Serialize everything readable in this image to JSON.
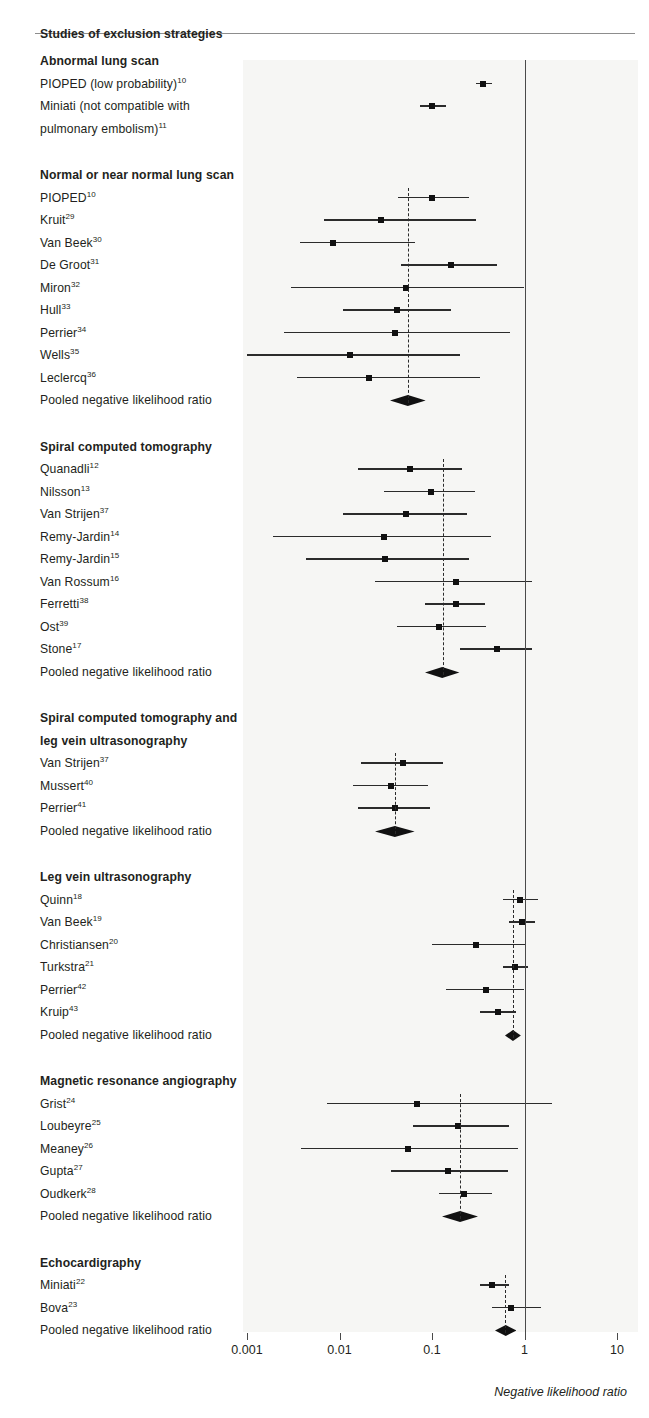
{
  "figure": {
    "title": "Studies of exclusion strategies",
    "axis_title": "Negative likelihood ratio",
    "pooled_label": "Pooled negative likelihood ratio"
  },
  "chart_data": {
    "type": "forest",
    "title": "Studies of exclusion strategies",
    "xlabel": "Negative likelihood ratio",
    "xscale": "log",
    "xlim": [
      0.001,
      10
    ],
    "ticks": [
      "0.001",
      "0.01",
      "0.1",
      "1",
      "10"
    ],
    "tick_values": [
      0.001,
      0.01,
      0.1,
      1,
      10
    ],
    "reference_line": 1,
    "effect_measure": "Negative likelihood ratio",
    "groups": [
      {
        "name": "Abnormal lung scan",
        "pooled": null,
        "studies": [
          {
            "label": "PIOPED (low probability)",
            "ref": "10",
            "estimate": 0.36,
            "lower": 0.3,
            "upper": 0.45
          },
          {
            "label": "Miniati (not compatible with pulmonary embolism)",
            "ref": "11",
            "estimate": 0.1,
            "lower": 0.075,
            "upper": 0.14
          }
        ]
      },
      {
        "name": "Normal or near normal lung scan",
        "pooled": {
          "estimate": 0.055,
          "lower": 0.035,
          "upper": 0.085
        },
        "studies": [
          {
            "label": "PIOPED",
            "ref": "10",
            "estimate": 0.1,
            "lower": 0.043,
            "upper": 0.25
          },
          {
            "label": "Kruit",
            "ref": "29",
            "estimate": 0.028,
            "lower": 0.0068,
            "upper": 0.3
          },
          {
            "label": "Van Beek",
            "ref": "30",
            "estimate": 0.0085,
            "lower": 0.0037,
            "upper": 0.065
          },
          {
            "label": "De Groot",
            "ref": "31",
            "estimate": 0.16,
            "lower": 0.046,
            "upper": 0.5
          },
          {
            "label": "Miron",
            "ref": "32",
            "estimate": 0.053,
            "lower": 0.003,
            "upper": 1.0
          },
          {
            "label": "Hull",
            "ref": "33",
            "estimate": 0.042,
            "lower": 0.011,
            "upper": 0.16
          },
          {
            "label": "Perrier",
            "ref": "34",
            "estimate": 0.04,
            "lower": 0.0025,
            "upper": 0.7
          },
          {
            "label": "Wells",
            "ref": "35",
            "estimate": 0.013,
            "lower": 0.001,
            "upper": 0.2
          },
          {
            "label": "Leclercq",
            "ref": "36",
            "estimate": 0.021,
            "lower": 0.0035,
            "upper": 0.33
          }
        ]
      },
      {
        "name": "Spiral computed tomography",
        "pooled": {
          "estimate": 0.13,
          "lower": 0.085,
          "upper": 0.2
        },
        "studies": [
          {
            "label": "Quanadli",
            "ref": "12",
            "estimate": 0.058,
            "lower": 0.016,
            "upper": 0.21
          },
          {
            "label": "Nilsson",
            "ref": "13",
            "estimate": 0.098,
            "lower": 0.03,
            "upper": 0.29
          },
          {
            "label": "Van Strijen",
            "ref": "37",
            "estimate": 0.053,
            "lower": 0.011,
            "upper": 0.24
          },
          {
            "label": "Remy-Jardin",
            "ref": "14",
            "estimate": 0.03,
            "lower": 0.0019,
            "upper": 0.43
          },
          {
            "label": "Remy-Jardin",
            "ref": "15",
            "estimate": 0.031,
            "lower": 0.0043,
            "upper": 0.25
          },
          {
            "label": "Van Rossum",
            "ref": "16",
            "estimate": 0.18,
            "lower": 0.024,
            "upper": 1.2
          },
          {
            "label": "Ferretti",
            "ref": "38",
            "estimate": 0.18,
            "lower": 0.085,
            "upper": 0.37
          },
          {
            "label": "Ost",
            "ref": "39",
            "estimate": 0.12,
            "lower": 0.042,
            "upper": 0.38
          },
          {
            "label": "Stone",
            "ref": "17",
            "estimate": 0.5,
            "lower": 0.2,
            "upper": 1.2
          }
        ]
      },
      {
        "name": "Spiral computed tomography and leg vein ultrasonography",
        "pooled": {
          "estimate": 0.04,
          "lower": 0.025,
          "upper": 0.067
        },
        "studies": [
          {
            "label": "Van Strijen",
            "ref": "37",
            "estimate": 0.048,
            "lower": 0.017,
            "upper": 0.13
          },
          {
            "label": "Mussert",
            "ref": "40",
            "estimate": 0.036,
            "lower": 0.014,
            "upper": 0.09
          },
          {
            "label": "Perrier",
            "ref": "41",
            "estimate": 0.04,
            "lower": 0.016,
            "upper": 0.095
          }
        ]
      },
      {
        "name": "Leg vein ultrasonography",
        "pooled": {
          "estimate": 0.75,
          "lower": 0.62,
          "upper": 0.92
        },
        "studies": [
          {
            "label": "Quinn",
            "ref": "18",
            "estimate": 0.9,
            "lower": 0.58,
            "upper": 1.4
          },
          {
            "label": "Van Beek",
            "ref": "19",
            "estimate": 0.93,
            "lower": 0.68,
            "upper": 1.3
          },
          {
            "label": "Christiansen",
            "ref": "20",
            "estimate": 0.3,
            "lower": 0.1,
            "upper": 1.0
          },
          {
            "label": "Turkstra",
            "ref": "21",
            "estimate": 0.78,
            "lower": 0.58,
            "upper": 1.1
          },
          {
            "label": "Perrier",
            "ref": "42",
            "estimate": 0.38,
            "lower": 0.14,
            "upper": 1.0
          },
          {
            "label": "Kruip",
            "ref": "43",
            "estimate": 0.52,
            "lower": 0.33,
            "upper": 0.8
          }
        ]
      },
      {
        "name": "Magnetic resonance angiography",
        "pooled": {
          "estimate": 0.2,
          "lower": 0.13,
          "upper": 0.32
        },
        "studies": [
          {
            "label": "Grist",
            "ref": "24",
            "estimate": 0.068,
            "lower": 0.0073,
            "upper": 2.0
          },
          {
            "label": "Loubeyre",
            "ref": "25",
            "estimate": 0.19,
            "lower": 0.063,
            "upper": 0.68
          },
          {
            "label": "Meaney",
            "ref": "26",
            "estimate": 0.055,
            "lower": 0.0038,
            "upper": 0.85
          },
          {
            "label": "Gupta",
            "ref": "27",
            "estimate": 0.15,
            "lower": 0.036,
            "upper": 0.66
          },
          {
            "label": "Oudkerk",
            "ref": "28",
            "estimate": 0.22,
            "lower": 0.12,
            "upper": 0.45
          }
        ]
      },
      {
        "name": "Echocardigraphy",
        "pooled": {
          "estimate": 0.62,
          "lower": 0.48,
          "upper": 0.82
        },
        "studies": [
          {
            "label": "Miniati",
            "ref": "22",
            "estimate": 0.45,
            "lower": 0.33,
            "upper": 0.68
          },
          {
            "label": "Bova",
            "ref": "23",
            "estimate": 0.72,
            "lower": 0.44,
            "upper": 1.5
          }
        ]
      }
    ]
  }
}
